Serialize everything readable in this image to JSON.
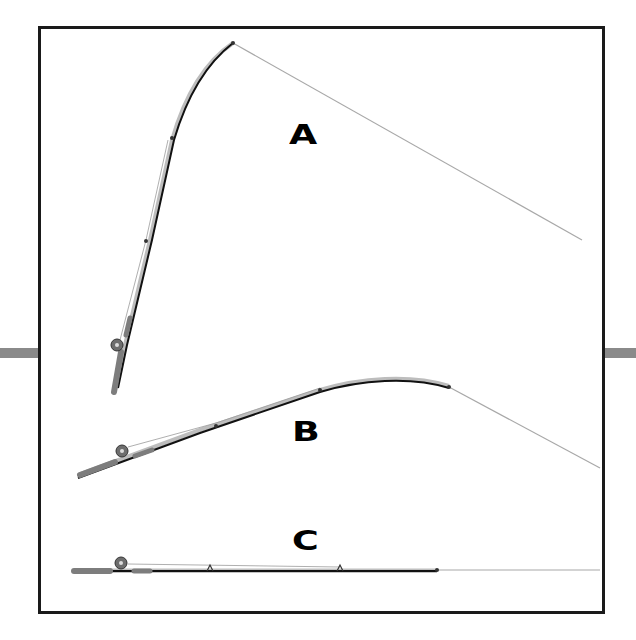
{
  "diagram": {
    "title": "",
    "frame": {
      "border_color": "#1a1a1a",
      "background": "#ffffff"
    },
    "side_bars": {
      "color": "#8a8a8a"
    },
    "panels": [
      {
        "id": "A",
        "label": "A",
        "description": "Rod strongly bent upward, line angling down to the right"
      },
      {
        "id": "B",
        "label": "B",
        "description": "Rod moderately bent, low angle, line angling down to the right"
      },
      {
        "id": "C",
        "label": "C",
        "description": "Rod held straight and level, line extending straight out"
      }
    ],
    "colors": {
      "rod": "#111111",
      "rod_highlight": "#bdbdbd",
      "line": "#a8a8a8",
      "grip": "#7d7d7d",
      "reel": "#6e6e6e"
    }
  }
}
